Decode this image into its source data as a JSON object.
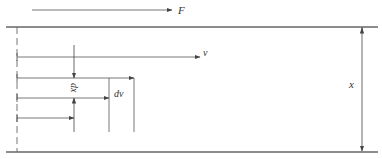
{
  "diagram": {
    "labels": {
      "force": "F",
      "velocity": "v",
      "distance": "x",
      "dx": "dx",
      "dv": "dv"
    },
    "colors": {
      "line": "#555555",
      "plate": "#666666",
      "text": "#333333",
      "background": "#ffffff"
    }
  }
}
